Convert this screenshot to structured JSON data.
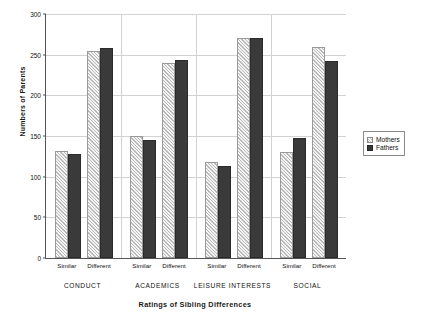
{
  "chart_data": {
    "type": "bar",
    "title": "",
    "xlabel": "Ratings of Sibling Differences",
    "ylabel": "Numbers of Parents",
    "ylim": [
      0,
      300
    ],
    "yticks": [
      0,
      50,
      100,
      150,
      200,
      250,
      300
    ],
    "ytick_labels": [
      "0",
      "50",
      "100",
      "150",
      "200",
      "250",
      "300"
    ],
    "grid": true,
    "legend_position": "right",
    "group_labels": [
      "CONDUCT",
      "ACADEMICS",
      "LEISURE INTERESTS",
      "SOCIAL"
    ],
    "sub_labels": [
      "Similar",
      "Different"
    ],
    "categories": [
      "CONDUCT Similar",
      "CONDUCT Different",
      "ACADEMICS Similar",
      "ACADEMICS Different",
      "LEISURE INTERESTS Similar",
      "LEISURE INTERESTS Different",
      "SOCIAL Similar",
      "SOCIAL Different"
    ],
    "series": [
      {
        "name": "Mothers",
        "color": "#e8e8e8",
        "values": [
          132,
          255,
          150,
          240,
          118,
          270,
          130,
          259
        ]
      },
      {
        "name": "Fathers",
        "color": "#3a3a3a",
        "values": [
          128,
          258,
          145,
          243,
          113,
          270,
          147,
          242
        ]
      }
    ]
  },
  "legend": {
    "items": [
      {
        "label": "Mothers"
      },
      {
        "label": "Fathers"
      }
    ]
  }
}
